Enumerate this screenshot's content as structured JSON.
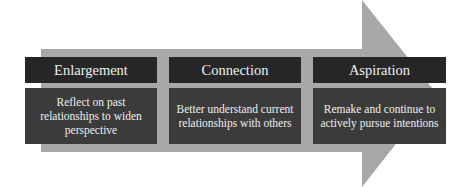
{
  "colors": {
    "arrow": "#a8a8a8",
    "header_bg": "#262626",
    "body_bg": "#3b3b3b",
    "text": "#eeeeee"
  },
  "stages": [
    {
      "title": "Enlargement",
      "description": "Reflect on past relationships to widen perspective"
    },
    {
      "title": "Connection",
      "description": "Better understand current relationships with others"
    },
    {
      "title": "Aspiration",
      "description": "Remake and continue to actively pursue intentions"
    }
  ]
}
